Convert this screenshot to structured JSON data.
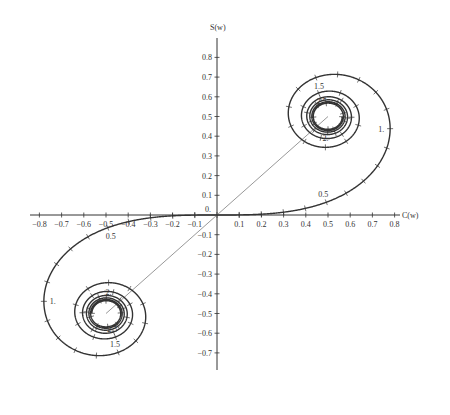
{
  "chart_data": {
    "type": "line",
    "title": "",
    "xlabel": "C(w)",
    "ylabel": "S(w)",
    "xlim": [
      -0.85,
      0.85
    ],
    "ylim": [
      -0.78,
      0.9
    ],
    "grid": false,
    "legend": null,
    "x_ticks": [
      "-0.8",
      "-0.7",
      "-0.6",
      "-0.5",
      "-0.4",
      "-0.3",
      "-0.2",
      "-0.1",
      "0.1",
      "0.2",
      "0.3",
      "0.4",
      "0.5",
      "0.6",
      "0.7",
      "0.8"
    ],
    "y_ticks": [
      "0.8",
      "0.7",
      "0.6",
      "0.5",
      "0.4",
      "0.3",
      "0.2",
      "0.1",
      "0.",
      "-0.1",
      "-0.2",
      "-0.3",
      "-0.4",
      "-0.5",
      "-0.6",
      "-0.7"
    ],
    "series": [
      {
        "name": "Cornu spiral (C(w), S(w))",
        "parameter": "w",
        "parameter_range": [
          -5,
          5
        ],
        "tick_step": 0.1,
        "asymptotes": [
          [
            0.5,
            0.5
          ],
          [
            -0.5,
            -0.5
          ]
        ],
        "color": "#333333",
        "point_labels": [
          {
            "w": 0.5,
            "label": "0.5"
          },
          {
            "w": 1.0,
            "label": "1."
          },
          {
            "w": 1.5,
            "label": "1.5"
          },
          {
            "w": 2.0,
            "label": "2."
          },
          {
            "w": 2.5,
            "label": "2.5"
          },
          {
            "w": -0.5,
            "label": "0.5"
          },
          {
            "w": -1.0,
            "label": "1."
          },
          {
            "w": -1.5,
            "label": "1.5"
          },
          {
            "w": -2.0,
            "label": "2."
          },
          {
            "w": -2.5,
            "label": "2.5"
          }
        ]
      },
      {
        "name": "asymptote line",
        "x": [
          -0.5,
          0.5
        ],
        "y": [
          -0.5,
          0.5
        ],
        "color": "#999999"
      }
    ]
  },
  "axes": {
    "x_label": "C(w)",
    "y_label": "S(w)",
    "origin_label": "0."
  }
}
